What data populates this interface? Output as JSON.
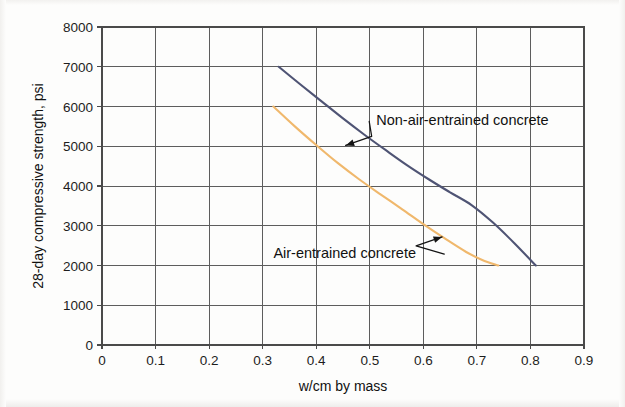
{
  "chart_data": {
    "type": "line",
    "title": "",
    "xlabel": "w/cm by mass",
    "ylabel": "28-day compressive strength, psi",
    "xlim": [
      0,
      0.9
    ],
    "ylim": [
      0,
      8000
    ],
    "xticks": [
      "0",
      "0.1",
      "0.2",
      "0.3",
      "0.4",
      "0.5",
      "0.6",
      "0.7",
      "0.8",
      "0.9"
    ],
    "xtick_values": [
      0,
      0.1,
      0.2,
      0.3,
      0.4,
      0.5,
      0.6,
      0.7,
      0.8,
      0.9
    ],
    "yticks": [
      "0",
      "1000",
      "2000",
      "3000",
      "4000",
      "5000",
      "6000",
      "7000",
      "8000"
    ],
    "ytick_values": [
      0,
      1000,
      2000,
      3000,
      4000,
      5000,
      6000,
      7000,
      8000
    ],
    "grid": true,
    "legend_position": "inline-annotations",
    "series": [
      {
        "name": "Non-air-entrained concrete",
        "color": "#4f5474",
        "x": [
          0.33,
          0.37,
          0.41,
          0.45,
          0.49,
          0.53,
          0.57,
          0.61,
          0.65,
          0.69,
          0.73,
          0.77,
          0.81
        ],
        "values": [
          7000,
          6560,
          6130,
          5700,
          5290,
          4900,
          4520,
          4170,
          3840,
          3520,
          3080,
          2560,
          2000
        ]
      },
      {
        "name": "Air-entrained concrete",
        "color": "#f0b86c",
        "x": [
          0.32,
          0.36,
          0.4,
          0.44,
          0.48,
          0.52,
          0.56,
          0.6,
          0.64,
          0.68,
          0.71,
          0.74
        ],
        "values": [
          6000,
          5500,
          5030,
          4580,
          4170,
          3790,
          3420,
          3040,
          2680,
          2340,
          2140,
          2000
        ]
      }
    ],
    "annotations": [
      {
        "text": "Non-air-entrained concrete",
        "series": "Non-air-entrained concrete",
        "points_to": [
          0.455,
          5020
        ],
        "label_position": [
          0.512,
          5650
        ]
      },
      {
        "text": "Air-entrained concrete",
        "series": "Air-entrained concrete",
        "points_to": [
          0.635,
          2720
        ],
        "label_position": [
          0.32,
          2310
        ]
      }
    ]
  }
}
